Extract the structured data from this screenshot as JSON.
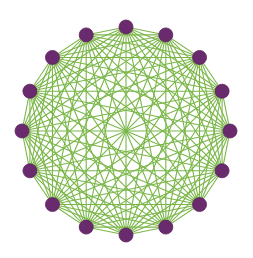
{
  "diagram": {
    "type": "complete-graph",
    "name": "K16",
    "node_count": 16,
    "center": [
      126,
      131
    ],
    "radius": 104,
    "node_radius": 7,
    "start_angle_deg": -90,
    "colors": {
      "background": "#ffffff",
      "node_fill": "#6a2a6e",
      "node_stroke": "#5a2060",
      "edge": "#7ab648"
    },
    "edge_width": 1.1,
    "nodes": [
      {
        "id": 0
      },
      {
        "id": 1
      },
      {
        "id": 2
      },
      {
        "id": 3
      },
      {
        "id": 4
      },
      {
        "id": 5
      },
      {
        "id": 6
      },
      {
        "id": 7
      },
      {
        "id": 8
      },
      {
        "id": 9
      },
      {
        "id": 10
      },
      {
        "id": 11
      },
      {
        "id": 12
      },
      {
        "id": 13
      },
      {
        "id": 14
      },
      {
        "id": 15
      }
    ]
  }
}
